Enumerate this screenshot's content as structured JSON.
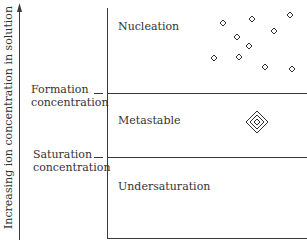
{
  "diagram": {
    "y_axis_label": "Increasing ion concentration in solution",
    "levels": [
      {
        "name": "formation",
        "label_line1": "Formation",
        "label_line2": "concentration"
      },
      {
        "name": "saturation",
        "label_line1": "Saturation",
        "label_line2": "concentration"
      }
    ],
    "regions": [
      {
        "name": "nucleation",
        "label": "Nucleation"
      },
      {
        "name": "metastable",
        "label": "Metastable"
      },
      {
        "name": "undersaturation",
        "label": "Undersaturation"
      }
    ],
    "symbols": {
      "nuclei": "small-diamond-icon",
      "crystal_growth": "concentric-diamond-icon"
    },
    "colors": {
      "line": "#3a3a3a",
      "text": "#333333",
      "background": "#ffffff"
    }
  }
}
